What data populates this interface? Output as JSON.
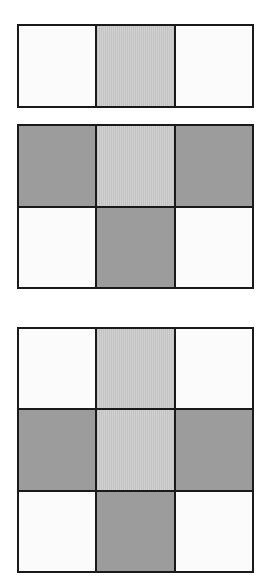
{
  "colors": {
    "white": "#fbfbfb",
    "light": "#c9c9c9",
    "dark": "#9c9c9c",
    "border": "#1a1a1a"
  },
  "grids": [
    {
      "name": "grid-top",
      "rows": 1,
      "cols": 3,
      "cells": [
        [
          "white",
          "light",
          "white"
        ]
      ]
    },
    {
      "name": "grid-middle",
      "rows": 2,
      "cols": 3,
      "cells": [
        [
          "dark",
          "light",
          "dark"
        ],
        [
          "white",
          "dark",
          "white"
        ]
      ]
    },
    {
      "name": "grid-bottom",
      "rows": 3,
      "cols": 3,
      "cells": [
        [
          "white",
          "light",
          "white"
        ],
        [
          "dark",
          "light",
          "dark"
        ],
        [
          "white",
          "dark",
          "white"
        ]
      ]
    }
  ]
}
